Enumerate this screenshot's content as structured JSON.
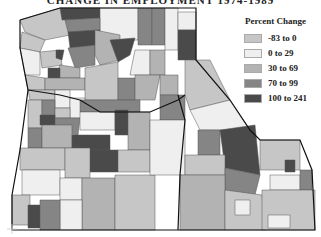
{
  "title": "CHANGE IN EMPLOYMENT 1974-1989",
  "legend": {
    "title": "Percent Change",
    "items": [
      {
        "label": "-83 to 0",
        "color": "#c6c6c6"
      },
      {
        "label": "0 to 29",
        "color": "#efefef"
      },
      {
        "label": "30 to 69",
        "color": "#b3b3b3"
      },
      {
        "label": "70 to 99",
        "color": "#858585"
      },
      {
        "label": "100 to 241",
        "color": "#4a4a4a"
      }
    ]
  },
  "regions": [
    "Washington",
    "Oregon",
    "Idaho"
  ]
}
